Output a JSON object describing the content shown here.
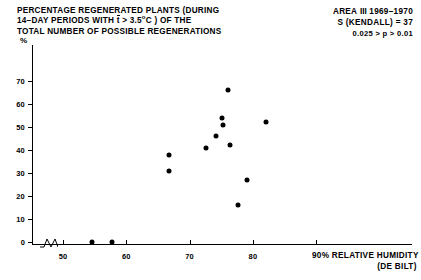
{
  "title": {
    "line1_a": "PERCENTAGE REGENERATED PLANTS (DURING",
    "line2_a": "14–DAY PERIODS WITH ",
    "line2_tbar": "t",
    "line2_b": " > 3.5",
    "line2_sup": "o",
    "line2_c": "C ) OF THE",
    "line3": "TOTAL NUMBER OF POSSIBLE REGENERATIONS"
  },
  "meta": {
    "area_label": "AREA",
    "area_roman": "III",
    "years": "1969–1970",
    "statistic": "S (KENDALL) = 37",
    "pvalue": "0.025 > p > 0.01"
  },
  "axes": {
    "y_unit": "%",
    "y_ticks": [
      0,
      10,
      20,
      30,
      40,
      50,
      60,
      70
    ],
    "x_ticks": [
      50,
      60,
      70,
      80,
      90
    ],
    "x_title_line1": "90% RELATIVE HUMIDITY",
    "x_title_line2": "(DE BILT)",
    "x_unit_symbol": "%"
  },
  "chart_data": {
    "type": "scatter",
    "subtitle": "AREA III 1969–1970",
    "xlabel": "% RELATIVE HUMIDITY (DE BILT)",
    "ylabel": "%",
    "xlim": [
      44,
      104
    ],
    "ylim": [
      0,
      74
    ],
    "grid": false,
    "legend": null,
    "annotations": [
      "S (KENDALL) = 37",
      "0.025 > p > 0.01"
    ],
    "axis_break_x": true,
    "points": [
      {
        "x": 54.6,
        "y": 0
      },
      {
        "x": 57.8,
        "y": 0
      },
      {
        "x": 66.7,
        "y": 38
      },
      {
        "x": 66.7,
        "y": 31
      },
      {
        "x": 72.6,
        "y": 41
      },
      {
        "x": 74.1,
        "y": 46
      },
      {
        "x": 75.1,
        "y": 54
      },
      {
        "x": 75.2,
        "y": 51
      },
      {
        "x": 76.0,
        "y": 66
      },
      {
        "x": 76.4,
        "y": 42
      },
      {
        "x": 77.6,
        "y": 16
      },
      {
        "x": 79.0,
        "y": 27
      },
      {
        "x": 82.0,
        "y": 52
      }
    ]
  },
  "layout": {
    "plot_left_px": 32,
    "plot_bottom_px": 244,
    "x_px_per_unit": 6.33,
    "x_ref_value": 50,
    "x_ref_px": 63,
    "y_px_per_unit": 2.3,
    "y_ref_value": 0,
    "y_ref_px": 242
  }
}
